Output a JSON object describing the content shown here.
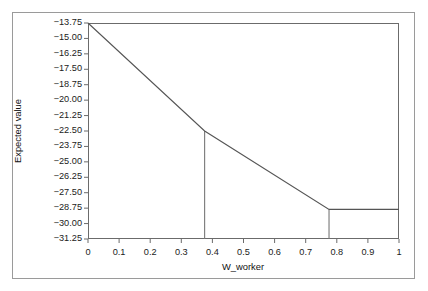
{
  "figure": {
    "background_color": "#ffffff",
    "outer_border_color": "#9a9a9a",
    "plot_border_color": "#6b6b6b",
    "line_color": "#555555",
    "marker_line_color": "#777777"
  },
  "chart_data": {
    "type": "line",
    "title": "",
    "subtitle": "",
    "xlabel": "W_worker",
    "ylabel": "Expected value",
    "xlim": [
      0,
      1
    ],
    "ylim": [
      -31.25,
      -13.75
    ],
    "grid": false,
    "legend": null,
    "legend_position": "none",
    "xticks": [
      0,
      0.1,
      0.2,
      0.3,
      0.4,
      0.5,
      0.6,
      0.7,
      0.8,
      0.9,
      1
    ],
    "xtick_labels": [
      "0",
      "0.1",
      "0.2",
      "0.3",
      "0.4",
      "0.5",
      "0.6",
      "0.7",
      "0.8",
      "0.9",
      "1"
    ],
    "yticks": [
      -13.75,
      -15.0,
      -16.25,
      -17.5,
      -18.75,
      -20.0,
      -21.25,
      -22.5,
      -23.75,
      -25.0,
      -26.25,
      -27.5,
      -28.75,
      -30.0,
      -31.25
    ],
    "ytick_labels": [
      "−13.75",
      "−15.00",
      "−16.25",
      "−17.50",
      "−18.75",
      "−20.00",
      "−21.25",
      "−22.50",
      "−23.75",
      "−25.00",
      "−26.25",
      "−27.50",
      "−28.75",
      "−30.00",
      "−31.25"
    ],
    "series": [
      {
        "name": "Expected value",
        "x": [
          0,
          0.375,
          0.775,
          1
        ],
        "values": [
          -13.75,
          -22.5,
          -28.85,
          -28.85
        ],
        "shape": "piecewise-linear",
        "breakpoints": [
          0.375,
          0.775
        ]
      }
    ],
    "annotations": [
      {
        "type": "vertical-drop-line",
        "x": 0.375,
        "y_top": -22.5,
        "y_bottom": -31.25,
        "label": ""
      },
      {
        "type": "vertical-drop-line",
        "x": 0.775,
        "y_top": -28.85,
        "y_bottom": -31.25,
        "label": ""
      }
    ]
  }
}
